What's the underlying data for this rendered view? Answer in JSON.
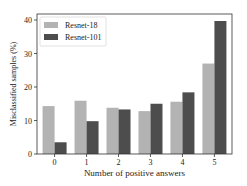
{
  "chart_data": {
    "type": "bar",
    "title": "",
    "xlabel": "Number of positive answers",
    "ylabel": "Misclassified samples (%)",
    "categories": [
      "0",
      "1",
      "2",
      "3",
      "4",
      "5"
    ],
    "series": [
      {
        "name": "Resnet-18",
        "color": "#b3b3b3",
        "values": [
          14.3,
          15.9,
          13.8,
          12.8,
          15.6,
          27.0
        ]
      },
      {
        "name": "Resnet-101",
        "color": "#4d4d4d",
        "values": [
          3.5,
          9.8,
          13.3,
          15.0,
          18.4,
          39.7
        ]
      }
    ],
    "ylim": [
      0,
      42
    ],
    "yticks": [
      0,
      10,
      20,
      30,
      40
    ],
    "grid": false,
    "legend_position": "upper left"
  }
}
